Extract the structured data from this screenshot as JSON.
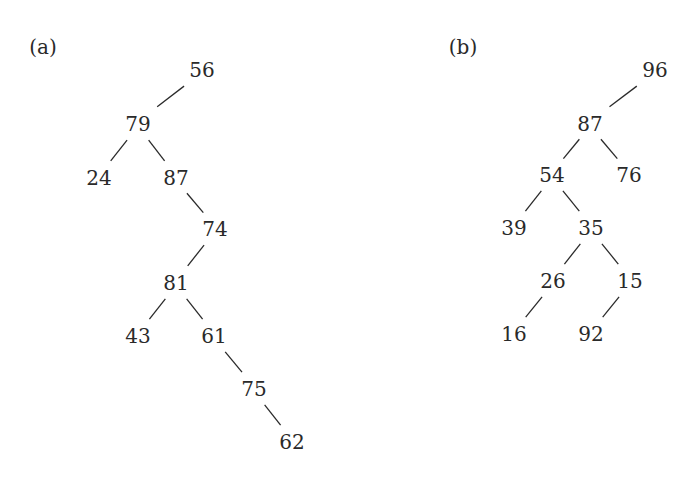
{
  "diagram": {
    "type": "binary-trees",
    "panels": [
      {
        "label": "(a)",
        "label_pos": [
          43,
          47
        ],
        "nodes": [
          {
            "id": "a56",
            "value": "56",
            "x": 202,
            "y": 70
          },
          {
            "id": "a79",
            "value": "79",
            "x": 138,
            "y": 124
          },
          {
            "id": "a24",
            "value": "24",
            "x": 99,
            "y": 178
          },
          {
            "id": "a87",
            "value": "87",
            "x": 176,
            "y": 178
          },
          {
            "id": "a74",
            "value": "74",
            "x": 215,
            "y": 229
          },
          {
            "id": "a81",
            "value": "81",
            "x": 176,
            "y": 283
          },
          {
            "id": "a43",
            "value": "43",
            "x": 138,
            "y": 336
          },
          {
            "id": "a61",
            "value": "61",
            "x": 214,
            "y": 336
          },
          {
            "id": "a75",
            "value": "75",
            "x": 254,
            "y": 389
          },
          {
            "id": "a62",
            "value": "62",
            "x": 292,
            "y": 442
          }
        ],
        "edges": [
          [
            "a56",
            "a79"
          ],
          [
            "a79",
            "a24"
          ],
          [
            "a79",
            "a87"
          ],
          [
            "a87",
            "a74"
          ],
          [
            "a74",
            "a81"
          ],
          [
            "a81",
            "a43"
          ],
          [
            "a81",
            "a61"
          ],
          [
            "a61",
            "a75"
          ],
          [
            "a75",
            "a62"
          ]
        ]
      },
      {
        "label": "(b)",
        "label_pos": [
          463,
          47
        ],
        "nodes": [
          {
            "id": "b96",
            "value": "96",
            "x": 655,
            "y": 70
          },
          {
            "id": "b87",
            "value": "87",
            "x": 590,
            "y": 124
          },
          {
            "id": "b54",
            "value": "54",
            "x": 552,
            "y": 175
          },
          {
            "id": "b76",
            "value": "76",
            "x": 629,
            "y": 175
          },
          {
            "id": "b39",
            "value": "39",
            "x": 514,
            "y": 228
          },
          {
            "id": "b35",
            "value": "35",
            "x": 591,
            "y": 228
          },
          {
            "id": "b26",
            "value": "26",
            "x": 553,
            "y": 281
          },
          {
            "id": "b15",
            "value": "15",
            "x": 630,
            "y": 281
          },
          {
            "id": "b16",
            "value": "16",
            "x": 514,
            "y": 334
          },
          {
            "id": "b92",
            "value": "92",
            "x": 591,
            "y": 334
          }
        ],
        "edges": [
          [
            "b96",
            "b87"
          ],
          [
            "b87",
            "b54"
          ],
          [
            "b87",
            "b76"
          ],
          [
            "b54",
            "b39"
          ],
          [
            "b54",
            "b35"
          ],
          [
            "b35",
            "b26"
          ],
          [
            "b35",
            "b15"
          ],
          [
            "b26",
            "b16"
          ],
          [
            "b15",
            "b92"
          ]
        ]
      }
    ]
  }
}
